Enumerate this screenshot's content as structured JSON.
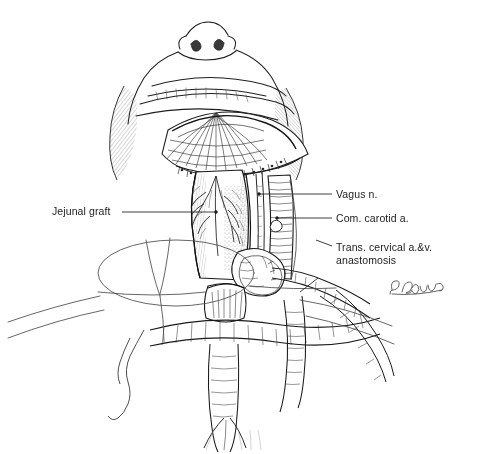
{
  "figure": {
    "type": "medical-line-illustration",
    "technique": "pen-and-ink stipple and hatching",
    "view": "submental / inferior view of head and neck with oral cavity retracted",
    "background_color": "#ffffff",
    "ink_color": "#1c1c1c",
    "signature": "P. Brown"
  },
  "labels": [
    {
      "id": "jejunal-graft",
      "text": "Jejunal graft",
      "side": "left",
      "lines": [
        "Jejunal graft"
      ]
    },
    {
      "id": "vagus-nerve",
      "text": "Vagus n.",
      "side": "right",
      "lines": [
        "Vagus n."
      ]
    },
    {
      "id": "common-carotid-artery",
      "text": "Com. carotid a.",
      "side": "right",
      "lines": [
        "Com. carotid a."
      ]
    },
    {
      "id": "transverse-cervical-anastomosis",
      "text": "Trans. cervical a.&v. anastomosis",
      "side": "right",
      "lines": [
        "Trans. cervical a.&v.",
        "anastomosis"
      ]
    }
  ]
}
